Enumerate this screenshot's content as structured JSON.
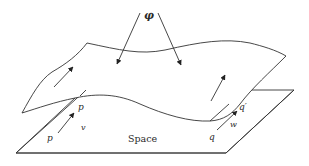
{
  "diagram": {
    "labels": {
      "map": "φ",
      "space": "Space",
      "point_p_plane": "p",
      "point_p_surface": "p",
      "vector_v": "v",
      "point_q": "q",
      "point_q_prime": "q′",
      "vector_w": "w"
    },
    "colors": {
      "stroke": "#333333",
      "background": "#ffffff"
    }
  }
}
